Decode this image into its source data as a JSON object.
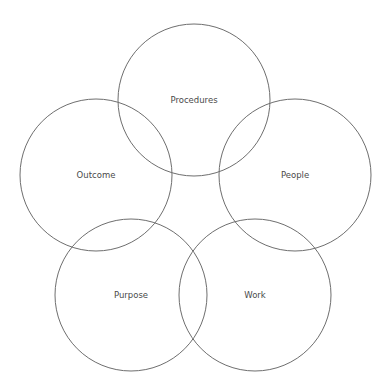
{
  "diagram": {
    "type": "five-circle-overlap",
    "stroke_color": "#6e6e6e",
    "text_color": "#4a4a4a",
    "nodes": [
      {
        "id": "procedures",
        "label": "Procedures",
        "cx": 194,
        "cy": 100,
        "r": 76
      },
      {
        "id": "outcome",
        "label": "Outcome",
        "cx": 96,
        "cy": 175,
        "r": 76
      },
      {
        "id": "people",
        "label": "People",
        "cx": 295,
        "cy": 175,
        "r": 76
      },
      {
        "id": "purpose",
        "label": "Purpose",
        "cx": 131,
        "cy": 295,
        "r": 76
      },
      {
        "id": "work",
        "label": "Work",
        "cx": 255,
        "cy": 295,
        "r": 76
      }
    ]
  }
}
